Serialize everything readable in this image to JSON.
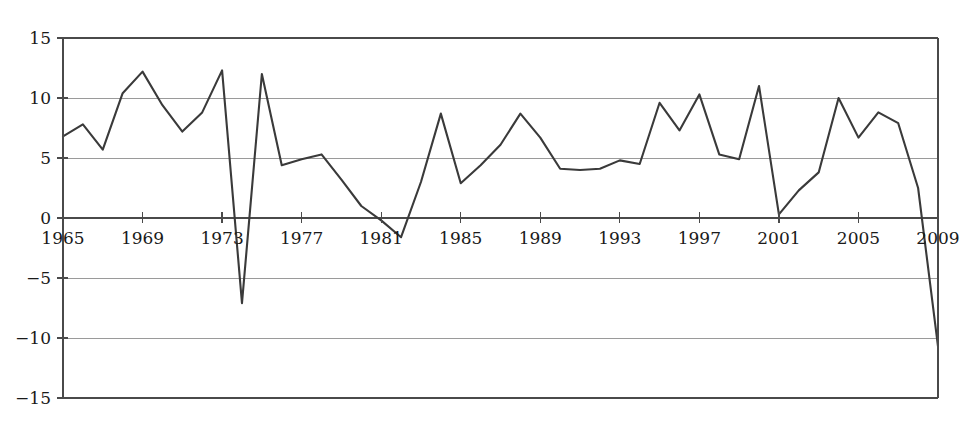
{
  "chart_data": {
    "type": "line",
    "title": "",
    "subtitle": "",
    "xlabel": "",
    "ylabel": "",
    "xlim": [
      1965,
      2009
    ],
    "ylim": [
      -15,
      15
    ],
    "grid": true,
    "legend": null,
    "legend_position": "none",
    "line_color": "#3a3a3a",
    "grid_color": "#9a9a9a",
    "axis_color": "#4a4a4a",
    "background_color": "#ffffff",
    "y_ticks": [
      15,
      10,
      5,
      0,
      -5,
      -10,
      -15
    ],
    "y_tick_labels": [
      "15",
      "10",
      "5",
      "0",
      "−5",
      "−10",
      "−15"
    ],
    "x_ticks": [
      1965,
      1969,
      1973,
      1977,
      1981,
      1985,
      1989,
      1993,
      1997,
      2001,
      2005,
      2009
    ],
    "x_tick_labels": [
      "1965",
      "1969",
      "1973",
      "1977",
      "1981",
      "1985",
      "1989",
      "1993",
      "1997",
      "2001",
      "2005",
      "2009"
    ],
    "x_axis_position": "zero",
    "x": [
      1965,
      1966,
      1967,
      1968,
      1969,
      1970,
      1971,
      1972,
      1973,
      1974,
      1975,
      1976,
      1977,
      1978,
      1979,
      1980,
      1981,
      1982,
      1983,
      1984,
      1985,
      1986,
      1987,
      1988,
      1989,
      1990,
      1991,
      1992,
      1993,
      1994,
      1995,
      1996,
      1997,
      1998,
      1999,
      2000,
      2001,
      2002,
      2003,
      2004,
      2005,
      2006,
      2007,
      2008,
      2009
    ],
    "values": [
      6.8,
      7.8,
      5.7,
      10.4,
      12.2,
      9.4,
      7.2,
      8.8,
      12.3,
      -7.1,
      12.0,
      4.4,
      4.9,
      5.3,
      3.2,
      1.0,
      -0.2,
      -1.6,
      3.0,
      8.7,
      2.9,
      4.4,
      6.1,
      8.7,
      6.7,
      4.1,
      4.0,
      4.1,
      4.8,
      4.5,
      9.6,
      7.3,
      10.3,
      5.3,
      4.9,
      11.0,
      0.3,
      2.3,
      3.8,
      10.0,
      6.7,
      8.8,
      7.9,
      2.5,
      -10.7
    ]
  }
}
